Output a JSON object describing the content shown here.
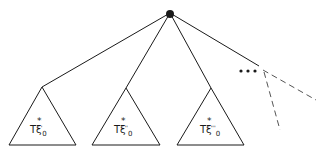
{
  "diagram": {
    "type": "tree",
    "colors": {
      "line": "#1a1a1a",
      "background": "#ffffff",
      "dashed": "#555555"
    },
    "root": {
      "x": 170,
      "y": 13,
      "r": 4
    },
    "subtrees": [
      {
        "apex": [
          42,
          87
        ],
        "base": [
          [
            9,
            145
          ],
          [
            76,
            145
          ]
        ],
        "label_main": "Tξ",
        "label_star": "*",
        "label_sub": "0",
        "label_prime": "'"
      },
      {
        "apex": [
          126,
          88
        ],
        "base": [
          [
            92,
            145
          ],
          [
            160,
            145
          ]
        ],
        "label_main": "Tξ",
        "label_star": "*",
        "label_sub": "0",
        "label_prime": "''"
      },
      {
        "apex": [
          211,
          88
        ],
        "base": [
          [
            177,
            145
          ],
          [
            244,
            145
          ]
        ],
        "label_main": "Tξ",
        "label_star": "*",
        "label_sub": "0",
        "label_prime": "'''"
      }
    ],
    "ellipsis": "•••",
    "ellipsis_edge_end": [
      259,
      66
    ],
    "dashed_branches": [
      {
        "from": [
          263,
          70
        ],
        "to": [
          316,
          100
        ]
      },
      {
        "from": [
          264,
          72
        ],
        "to": [
          280,
          130
        ]
      }
    ]
  }
}
